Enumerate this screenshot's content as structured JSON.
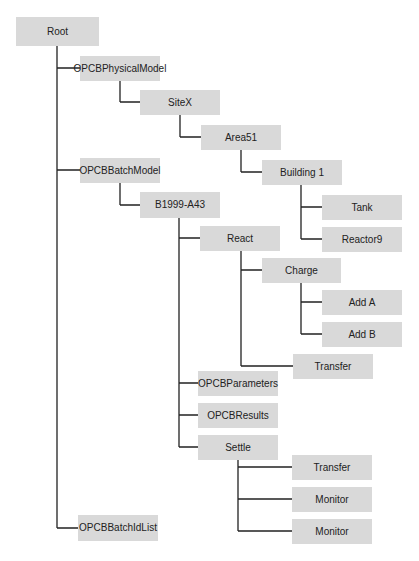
{
  "diagram": {
    "box_color": "#d9d9d9",
    "line_color": "#222222",
    "nodes": [
      {
        "id": "root",
        "label": "Root",
        "x": 16,
        "y": 17,
        "w": 83,
        "h": 29
      },
      {
        "id": "physical-model",
        "label": "OPCBPhysicalModel",
        "x": 80,
        "y": 56,
        "w": 80,
        "h": 25,
        "parent": "root"
      },
      {
        "id": "sitex",
        "label": "SiteX",
        "x": 140,
        "y": 90,
        "w": 80,
        "h": 25,
        "parent": "physical-model"
      },
      {
        "id": "area51",
        "label": "Area51",
        "x": 201,
        "y": 125,
        "w": 80,
        "h": 25,
        "parent": "sitex"
      },
      {
        "id": "building1",
        "label": "Building 1",
        "x": 262,
        "y": 160,
        "w": 80,
        "h": 25,
        "parent": "area51"
      },
      {
        "id": "tank",
        "label": "Tank",
        "x": 322,
        "y": 195,
        "w": 80,
        "h": 25,
        "parent": "building1"
      },
      {
        "id": "reactor9",
        "label": "Reactor9",
        "x": 322,
        "y": 227,
        "w": 80,
        "h": 25,
        "parent": "building1"
      },
      {
        "id": "batch-model",
        "label": "OPCBBatchModel",
        "x": 80,
        "y": 158,
        "w": 80,
        "h": 25,
        "parent": "root"
      },
      {
        "id": "b1999-a43",
        "label": "B1999-A43",
        "x": 140,
        "y": 192,
        "w": 80,
        "h": 26,
        "parent": "batch-model"
      },
      {
        "id": "react",
        "label": "React",
        "x": 200,
        "y": 226,
        "w": 80,
        "h": 25,
        "parent": "b1999-a43"
      },
      {
        "id": "charge",
        "label": "Charge",
        "x": 262,
        "y": 258,
        "w": 79,
        "h": 25,
        "parent": "react"
      },
      {
        "id": "add-a",
        "label": "Add A",
        "x": 322,
        "y": 290,
        "w": 80,
        "h": 25,
        "parent": "charge"
      },
      {
        "id": "add-b",
        "label": "Add B",
        "x": 322,
        "y": 322,
        "w": 80,
        "h": 25,
        "parent": "charge"
      },
      {
        "id": "react-transfer",
        "label": "Transfer",
        "x": 293,
        "y": 354,
        "w": 80,
        "h": 25,
        "parent": "react"
      },
      {
        "id": "parameters",
        "label": "OPCBParameters",
        "x": 198,
        "y": 371,
        "w": 80,
        "h": 25,
        "parent": "b1999-a43"
      },
      {
        "id": "results",
        "label": "OPCBResults",
        "x": 198,
        "y": 403,
        "w": 80,
        "h": 25,
        "parent": "b1999-a43"
      },
      {
        "id": "settle",
        "label": "Settle",
        "x": 198,
        "y": 435,
        "w": 80,
        "h": 25,
        "parent": "b1999-a43"
      },
      {
        "id": "settle-transfer",
        "label": "Transfer",
        "x": 292,
        "y": 455,
        "w": 80,
        "h": 25,
        "parent": "settle"
      },
      {
        "id": "monitor-1",
        "label": "Monitor",
        "x": 292,
        "y": 487,
        "w": 80,
        "h": 25,
        "parent": "settle"
      },
      {
        "id": "monitor-2",
        "label": "Monitor",
        "x": 292,
        "y": 519,
        "w": 80,
        "h": 25,
        "parent": "settle"
      },
      {
        "id": "batch-id-list",
        "label": "OPCBBatchIdList",
        "x": 78,
        "y": 515,
        "w": 80,
        "h": 26,
        "parent": "root"
      }
    ],
    "connectors": [
      {
        "from": "root",
        "trunk_x": 57,
        "trunk_top": 46,
        "branch_ys": [
          68,
          170,
          528
        ],
        "branch_ends": [
          80,
          80,
          78
        ]
      },
      {
        "from": "physical-model",
        "trunk_x": 120,
        "trunk_top": 81,
        "branch_ys": [
          102
        ],
        "branch_ends": [
          140
        ]
      },
      {
        "from": "sitex",
        "trunk_x": 180,
        "trunk_top": 115,
        "branch_ys": [
          137
        ],
        "branch_ends": [
          201
        ]
      },
      {
        "from": "area51",
        "trunk_x": 241,
        "trunk_top": 150,
        "branch_ys": [
          172
        ],
        "branch_ends": [
          262
        ]
      },
      {
        "from": "building1",
        "trunk_x": 301,
        "trunk_top": 185,
        "branch_ys": [
          207,
          239
        ],
        "branch_ends": [
          322,
          322
        ]
      },
      {
        "from": "batch-model",
        "trunk_x": 120,
        "trunk_top": 183,
        "branch_ys": [
          205
        ],
        "branch_ends": [
          140
        ]
      },
      {
        "from": "b1999-a43",
        "trunk_x": 179,
        "trunk_top": 218,
        "branch_ys": [
          238,
          383,
          415,
          447
        ],
        "branch_ends": [
          200,
          198,
          198,
          198
        ]
      },
      {
        "from": "react",
        "trunk_x": 241,
        "trunk_top": 251,
        "branch_ys": [
          270,
          366
        ],
        "branch_ends": [
          262,
          293
        ]
      },
      {
        "from": "charge",
        "trunk_x": 301,
        "trunk_top": 283,
        "branch_ys": [
          302,
          334
        ],
        "branch_ends": [
          322,
          322
        ]
      },
      {
        "from": "settle",
        "trunk_x": 238,
        "trunk_top": 460,
        "branch_ys": [
          467,
          499,
          531
        ],
        "branch_ends": [
          292,
          292,
          292
        ]
      }
    ]
  }
}
